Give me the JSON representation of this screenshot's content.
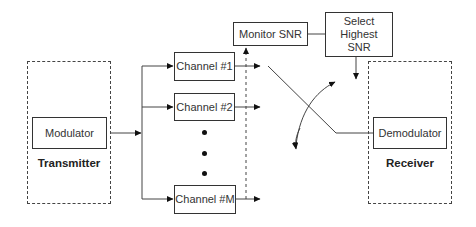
{
  "diagram": {
    "transmitter": {
      "label": "Transmitter",
      "modulator_label": "Modulator"
    },
    "channels": [
      {
        "label": "Channel #1"
      },
      {
        "label": "Channel #2"
      },
      {
        "label": "Channel #M"
      }
    ],
    "ellipsis_dots": 3,
    "monitor": {
      "label": "Monitor SNR"
    },
    "selector": {
      "label_lines": [
        "Select",
        "Highest",
        "SNR"
      ]
    },
    "receiver": {
      "label": "Receiver",
      "demodulator_label": "Demodulator"
    },
    "colors": {
      "line": "#333333",
      "background": "#ffffff"
    }
  }
}
